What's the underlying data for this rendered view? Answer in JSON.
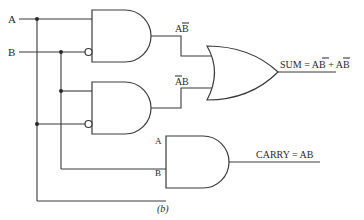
{
  "diagram": {
    "type": "logic-circuit",
    "caption": "(b)",
    "inputs": [
      {
        "label": "A"
      },
      {
        "label": "B"
      }
    ],
    "gates": [
      {
        "id": "and1",
        "type": "AND",
        "inputs": [
          "A",
          "NOT B"
        ],
        "output_label": "AB̄"
      },
      {
        "id": "and2",
        "type": "AND",
        "inputs": [
          "B",
          "NOT A"
        ],
        "output_label": "ĀB"
      },
      {
        "id": "or1",
        "type": "OR",
        "inputs": [
          "and1",
          "and2"
        ],
        "output_label": "SUM = AB̄ + ĀB"
      },
      {
        "id": "and3",
        "type": "AND",
        "inputs": [
          "A",
          "B"
        ],
        "input_labels": [
          "A",
          "B"
        ],
        "output_label": "CARRY = AB"
      }
    ],
    "labels": {
      "input_a": "A",
      "input_b": "B",
      "and1_out_main": "A",
      "and1_out_bar": "B",
      "and2_out_bar": "A",
      "and2_out_main": "B",
      "sum": "SUM = ",
      "sum_t1a": "A",
      "sum_t1b": "B",
      "sum_plus": " + ",
      "sum_t2a": "A",
      "sum_t2b": "B",
      "and3_in_a": "A",
      "and3_in_b": "B",
      "carry": "CARRY = AB",
      "caption": "(b)"
    }
  }
}
